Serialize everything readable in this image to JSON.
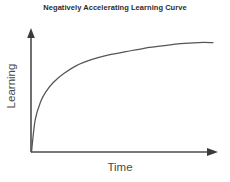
{
  "chart_data": {
    "type": "line",
    "title": "Negatively Accelerating Learning Curve",
    "xlabel": "Time",
    "ylabel": "Learning",
    "grid": false,
    "legend": null,
    "xlim": [
      0,
      100
    ],
    "ylim": [
      0,
      100
    ],
    "xticks": [],
    "yticks": [],
    "axis_style": "arrow-axes",
    "curve_color": "#555555",
    "axis_color": "#4d4d4d",
    "title_color": "#2b2b2b",
    "label_color": "#4a4a4a",
    "background_color": "#ffffff",
    "series": [
      {
        "name": "Learning over time",
        "description": "Negatively accelerating (decelerating) curve: rapid early gains that taper to an asymptote",
        "x": [
          0,
          2,
          5,
          8,
          12,
          18,
          25,
          33,
          42,
          52,
          62,
          72,
          82,
          92,
          100
        ],
        "y": [
          0,
          28,
          44,
          53,
          61,
          69,
          76,
          81,
          85,
          88,
          91,
          93,
          95,
          96,
          96
        ]
      }
    ]
  },
  "canvas": {
    "width": 230,
    "height": 182
  }
}
